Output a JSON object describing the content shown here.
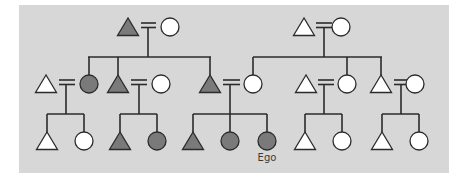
{
  "diagram": {
    "panel_color": "#d7d7d7",
    "colors": {
      "filled": "#7a7a7a",
      "open": "#ffffff",
      "stroke": "#2b2b2b"
    },
    "ego_label": "Ego",
    "legend": {
      "triangle": "male",
      "circle": "female",
      "equals": "marriage",
      "filled": "shaded kin group"
    },
    "individuals": [
      {
        "id": "g1-paternal-grandfather",
        "shape": "triangle",
        "filled": true,
        "x": 128,
        "y": 27
      },
      {
        "id": "g1-paternal-grandmother",
        "shape": "circle",
        "filled": false,
        "x": 170,
        "y": 27
      },
      {
        "id": "g1-maternal-grandfather",
        "shape": "triangle",
        "filled": false,
        "x": 304,
        "y": 27
      },
      {
        "id": "g1-maternal-grandmother",
        "shape": "circle",
        "filled": false,
        "x": 341,
        "y": 27
      },
      {
        "id": "g2-aunt-husband",
        "shape": "triangle",
        "filled": false,
        "x": 46,
        "y": 84
      },
      {
        "id": "g2-paternal-aunt",
        "shape": "circle",
        "filled": true,
        "x": 89,
        "y": 84
      },
      {
        "id": "g2-paternal-uncle",
        "shape": "triangle",
        "filled": true,
        "x": 118,
        "y": 84
      },
      {
        "id": "g2-uncle-wife",
        "shape": "circle",
        "filled": false,
        "x": 161,
        "y": 84
      },
      {
        "id": "g2-father",
        "shape": "triangle",
        "filled": true,
        "x": 210,
        "y": 84
      },
      {
        "id": "g2-mother",
        "shape": "circle",
        "filled": false,
        "x": 253,
        "y": 84
      },
      {
        "id": "g2-maternal-uncle-1",
        "shape": "triangle",
        "filled": false,
        "x": 306,
        "y": 84
      },
      {
        "id": "g2-maternal-aunt",
        "shape": "circle",
        "filled": false,
        "x": 347,
        "y": 84
      },
      {
        "id": "g2-maternal-uncle-2",
        "shape": "triangle",
        "filled": false,
        "x": 381,
        "y": 84
      },
      {
        "id": "g2-uncle-2-wife",
        "shape": "circle",
        "filled": false,
        "x": 415,
        "y": 84
      },
      {
        "id": "g3-cousin-1",
        "shape": "triangle",
        "filled": false,
        "x": 47,
        "y": 141
      },
      {
        "id": "g3-cousin-2",
        "shape": "circle",
        "filled": false,
        "x": 84,
        "y": 141
      },
      {
        "id": "g3-cousin-3",
        "shape": "triangle",
        "filled": true,
        "x": 120,
        "y": 141
      },
      {
        "id": "g3-cousin-4",
        "shape": "circle",
        "filled": true,
        "x": 157,
        "y": 141
      },
      {
        "id": "g3-brother",
        "shape": "triangle",
        "filled": true,
        "x": 193,
        "y": 141
      },
      {
        "id": "g3-sister",
        "shape": "circle",
        "filled": true,
        "x": 230,
        "y": 141
      },
      {
        "id": "g3-ego",
        "shape": "circle",
        "filled": true,
        "x": 267,
        "y": 141,
        "label": "Ego"
      },
      {
        "id": "g3-cousin-5",
        "shape": "triangle",
        "filled": false,
        "x": 305,
        "y": 141
      },
      {
        "id": "g3-cousin-6",
        "shape": "circle",
        "filled": false,
        "x": 342,
        "y": 141
      },
      {
        "id": "g3-cousin-7",
        "shape": "triangle",
        "filled": false,
        "x": 382,
        "y": 141
      },
      {
        "id": "g3-cousin-8",
        "shape": "circle",
        "filled": false,
        "x": 419,
        "y": 141
      }
    ]
  }
}
